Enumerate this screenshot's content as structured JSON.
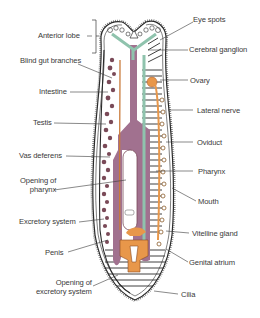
{
  "diagram": {
    "colors": {
      "outline": "#2a2a2a",
      "intestine": "#a1718f",
      "reproductive": "#e8974a",
      "nerve": "#8fc3ad",
      "background": "#ffffff",
      "label_text": "#3a3a3a"
    },
    "labels_left": [
      {
        "id": "anterior-lobe",
        "text": "Anterior lobe"
      },
      {
        "id": "blind-gut-branches",
        "text": "Blind gut branches"
      },
      {
        "id": "intestine",
        "text": "Intestine"
      },
      {
        "id": "testis",
        "text": "Testis"
      },
      {
        "id": "vas-deferens",
        "text": "Vas deferens"
      },
      {
        "id": "opening-of-pharynx",
        "text": "Opening of",
        "text2": "pharynx"
      },
      {
        "id": "excretory-system",
        "text": "Excretory system"
      },
      {
        "id": "penis",
        "text": "Penis"
      },
      {
        "id": "opening-of-excretory-system",
        "text": "Opening of",
        "text2": "excretory system"
      }
    ],
    "labels_right": [
      {
        "id": "eye-spots",
        "text": "Eye spots"
      },
      {
        "id": "cerebral-ganglion",
        "text": "Cerebral ganglion"
      },
      {
        "id": "ovary",
        "text": "Ovary"
      },
      {
        "id": "lateral-nerve",
        "text": "Lateral nerve"
      },
      {
        "id": "oviduct",
        "text": "Oviduct"
      },
      {
        "id": "pharynx",
        "text": "Pharynx"
      },
      {
        "id": "mouth",
        "text": "Mouth"
      },
      {
        "id": "vitelline-gland",
        "text": "Vitelline gland"
      },
      {
        "id": "genital-atrium",
        "text": "Genital atrium"
      },
      {
        "id": "cilia",
        "text": "Cilia"
      }
    ]
  }
}
